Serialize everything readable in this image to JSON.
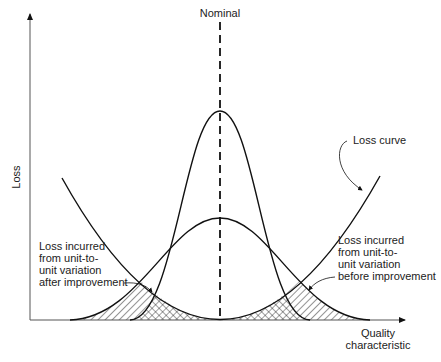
{
  "diagram": {
    "y_axis_label": "Loss",
    "x_axis_label_lines": [
      "Quality",
      "characteristic"
    ],
    "nominal_label": "Nominal",
    "loss_curve_label": "Loss curve",
    "after_improvement_label_lines": [
      "Loss incurred",
      "from unit-to-",
      "unit variation",
      "after improvement"
    ],
    "before_improvement_label_lines": [
      "Loss incurred",
      "from unit-to-",
      "unit variation",
      "before improvement"
    ],
    "colors": {
      "line": "#111111",
      "axis": "#555555",
      "background": "#ffffff"
    }
  }
}
